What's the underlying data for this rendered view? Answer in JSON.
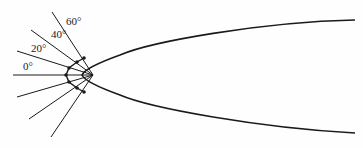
{
  "diagram": {
    "type": "parabolic reflector ray diagram",
    "angle_labels": [
      {
        "text": "0°",
        "x": 23,
        "y": 61
      },
      {
        "text": "20°",
        "x": 31,
        "y": 43
      },
      {
        "text": "40°",
        "x": 51,
        "y": 29
      },
      {
        "text": "60°",
        "x": 66,
        "y": 16
      }
    ],
    "focus": {
      "x": 93,
      "y": 75
    },
    "stroke_color": "#1a1a1a"
  }
}
